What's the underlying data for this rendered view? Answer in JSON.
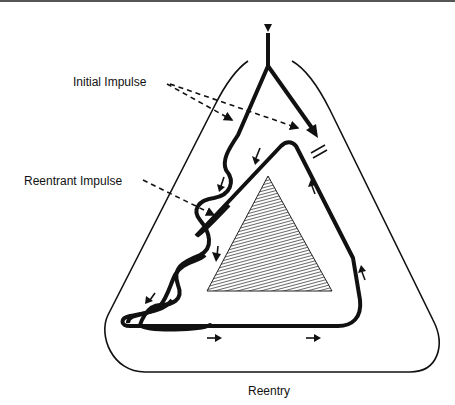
{
  "diagram": {
    "title": "Reentry",
    "labels": {
      "initial_impulse": "Initial Impulse",
      "reentrant_impulse": "Reentrant Impulse"
    },
    "elements": {
      "stimulus_marker": "downward-triangle",
      "block_marker": "double-bar",
      "central_obstacle": "hatched-triangle",
      "outer_boundary": "rounded-triangle"
    },
    "colors": {
      "ink": "#111111",
      "background": "#ffffff",
      "hatch": "#555555"
    }
  }
}
